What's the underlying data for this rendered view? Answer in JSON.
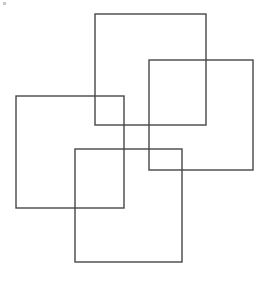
{
  "figure": {
    "title": "Four overlapping squares pinwheel",
    "canvas": {
      "width": 271,
      "height": 283,
      "background_color": "#ffffff"
    },
    "style": {
      "stroke_color": "#474747",
      "stroke_width": 1.4,
      "fill": "none"
    },
    "shapes": [
      {
        "id": "square-top",
        "label": "Top square",
        "position": "top-center",
        "x": 95,
        "y": 14,
        "width": 111,
        "height": 111
      },
      {
        "id": "square-right",
        "label": "Right square",
        "position": "middle-right",
        "x": 149,
        "y": 60,
        "width": 104,
        "height": 110
      },
      {
        "id": "square-left",
        "label": "Left square",
        "position": "middle-left",
        "x": 16,
        "y": 96,
        "width": 108,
        "height": 112
      },
      {
        "id": "square-bottom",
        "label": "Bottom square",
        "position": "bottom-center",
        "x": 75,
        "y": 149,
        "width": 107,
        "height": 113
      }
    ],
    "artifacts": [
      {
        "id": "scan-speck",
        "label": "Scan speck",
        "x": 3,
        "y": 2,
        "width": 3,
        "height": 3,
        "color": "#c9c9c9"
      }
    ],
    "shape_count": 4
  }
}
